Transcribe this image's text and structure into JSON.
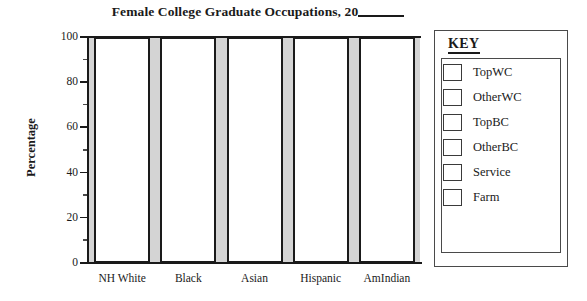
{
  "chart_data": {
    "type": "bar",
    "title": "Female College Graduate Occupations, 20",
    "title_blank_suffix": "____",
    "xlabel": "",
    "ylabel": "Percentage",
    "ylim": [
      0,
      100
    ],
    "ytick_labels": [
      "100",
      "80",
      "60",
      "40",
      "20",
      "0"
    ],
    "ytick_values": [
      100,
      80,
      60,
      40,
      20,
      0
    ],
    "minor_tick_values": [
      90,
      70,
      50,
      30,
      10
    ],
    "grid": false,
    "categories": [
      "NH White",
      "Black",
      "Asian",
      "Hispanic",
      "AmIndian"
    ],
    "series": [
      {
        "name": "TopWC",
        "values": [
          0,
          0,
          0,
          0,
          0
        ]
      },
      {
        "name": "OtherWC",
        "values": [
          0,
          0,
          0,
          0,
          0
        ]
      },
      {
        "name": "TopBC",
        "values": [
          0,
          0,
          0,
          0,
          0
        ]
      },
      {
        "name": "OtherBC",
        "values": [
          0,
          0,
          0,
          0,
          0
        ]
      },
      {
        "name": "Service",
        "values": [
          0,
          0,
          0,
          0,
          0
        ]
      },
      {
        "name": "Farm",
        "values": [
          0,
          0,
          0,
          0,
          0
        ]
      }
    ],
    "bars_blank": true,
    "bar_outline_color": "#1a1a1a",
    "bar_fill_color": "#ffffff",
    "plot_background_color": "#d4d4d4",
    "note": "Blank worksheet chart: each category column is an empty 0-100 stacked bar to be filled in."
  },
  "legend": {
    "title": "KEY",
    "position": "right",
    "items": [
      {
        "label": "TopWC",
        "swatch_color": "#ffffff"
      },
      {
        "label": "OtherWC",
        "swatch_color": "#ffffff"
      },
      {
        "label": "TopBC",
        "swatch_color": "#ffffff"
      },
      {
        "label": "OtherBC",
        "swatch_color": "#ffffff"
      },
      {
        "label": "Service",
        "swatch_color": "#ffffff"
      },
      {
        "label": "Farm",
        "swatch_color": "#ffffff"
      }
    ]
  }
}
